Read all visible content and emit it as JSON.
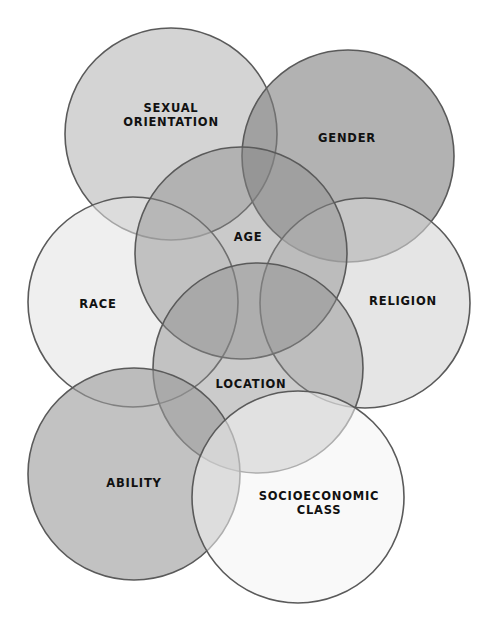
{
  "diagram": {
    "type": "venn-overlap",
    "background": "#ffffff",
    "stroke_color": "#5a5a5a",
    "circles": [
      {
        "id": "sexual-orientation",
        "label_lines": [
          "SEXUAL",
          "ORIENTATION"
        ],
        "cx": 171,
        "cy": 134,
        "r": 106,
        "fill": "#b8b8b8",
        "opacity": 0.6,
        "label_x": 171,
        "label_y": 112
      },
      {
        "id": "gender",
        "label_lines": [
          "GENDER"
        ],
        "cx": 348,
        "cy": 156,
        "r": 106,
        "fill": "#7e7e7e",
        "opacity": 0.6,
        "label_x": 347,
        "label_y": 142
      },
      {
        "id": "race",
        "label_lines": [
          "RACE"
        ],
        "cx": 133,
        "cy": 302,
        "r": 105,
        "fill": "#e2e2e2",
        "opacity": 0.55,
        "label_x": 98,
        "label_y": 308
      },
      {
        "id": "religion",
        "label_lines": [
          "RELIGION"
        ],
        "cx": 365,
        "cy": 303,
        "r": 105,
        "fill": "#d4d4d4",
        "opacity": 0.6,
        "label_x": 403,
        "label_y": 305
      },
      {
        "id": "age",
        "label_lines": [
          "AGE"
        ],
        "cx": 241,
        "cy": 253,
        "r": 106,
        "fill": "#8a8a8a",
        "opacity": 0.45,
        "label_x": 248,
        "label_y": 241
      },
      {
        "id": "location",
        "label_lines": [
          "LOCATION"
        ],
        "cx": 258,
        "cy": 368,
        "r": 105,
        "fill": "#8c8c8c",
        "opacity": 0.45,
        "label_x": 251,
        "label_y": 388
      },
      {
        "id": "ability",
        "label_lines": [
          "ABILITY"
        ],
        "cx": 134,
        "cy": 474,
        "r": 106,
        "fill": "#9a9a9a",
        "opacity": 0.6,
        "label_x": 134,
        "label_y": 487
      },
      {
        "id": "socioeconomic-class",
        "label_lines": [
          "SOCIOECONOMIC",
          "CLASS"
        ],
        "cx": 298,
        "cy": 497,
        "r": 106,
        "fill": "#f4f4f4",
        "opacity": 0.55,
        "label_x": 319,
        "label_y": 500
      }
    ]
  }
}
